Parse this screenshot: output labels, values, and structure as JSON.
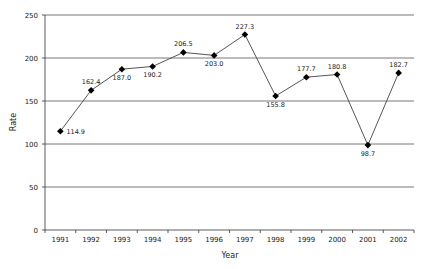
{
  "chart_data": {
    "type": "line",
    "title": "",
    "xlabel": "Year",
    "ylabel": "Rate",
    "categories": [
      "1991",
      "1992",
      "1993",
      "1994",
      "1995",
      "1996",
      "1997",
      "1998",
      "1999",
      "2000",
      "2001",
      "2002"
    ],
    "series": [
      {
        "name": "Rate",
        "values": [
          114.9,
          162.4,
          187.0,
          190.2,
          206.5,
          203.0,
          227.3,
          155.8,
          177.7,
          180.8,
          98.7,
          182.7
        ],
        "labels": [
          "114.9",
          "162.4",
          "187.0",
          "190.2",
          "206.5",
          "203.0",
          "227.3",
          "155.8",
          "177.7",
          "180.8",
          "98.7",
          "182.7"
        ],
        "label_pos": [
          "right",
          "above",
          "below",
          "below",
          "above",
          "below",
          "above",
          "below",
          "above",
          "above",
          "below",
          "above"
        ]
      }
    ],
    "ylim": [
      0,
      250
    ],
    "yticks": [
      0,
      50,
      100,
      150,
      200,
      250
    ],
    "grid": true,
    "legend": "none",
    "marker": "diamond",
    "colors": {
      "line": "#555555",
      "marker": "#000000",
      "grid": "#555555"
    }
  }
}
